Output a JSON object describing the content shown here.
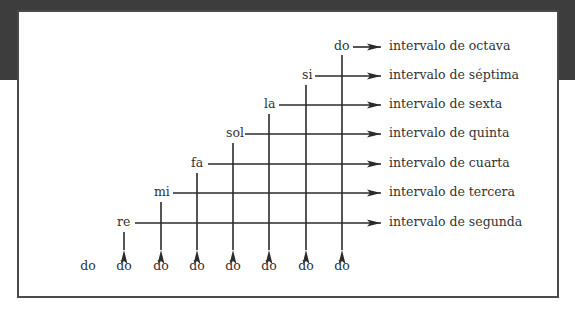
{
  "diagram": {
    "title": "",
    "base_notes": [
      "do",
      "do",
      "do",
      "do",
      "do",
      "do",
      "do",
      "do"
    ],
    "notes": [
      {
        "label": "re",
        "interval": "intervalo de segunda"
      },
      {
        "label": "mi",
        "interval": "intervalo de tercera"
      },
      {
        "label": "fa",
        "interval": "intervalo de cuarta"
      },
      {
        "label": "sol",
        "interval": "intervalo de quinta"
      },
      {
        "label": "la",
        "interval": "intervalo de sexta"
      },
      {
        "label": "si",
        "interval": "intervalo de séptima"
      },
      {
        "label": "do",
        "interval": "intervalo de octava"
      }
    ],
    "colors": {
      "line": "#2b2b2b",
      "text": "#333333",
      "background_band": "#3d3d3d",
      "frame_border": "#4a4a4a"
    }
  }
}
